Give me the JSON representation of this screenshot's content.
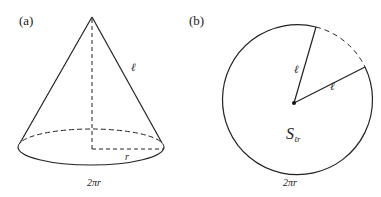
{
  "panel_a": {
    "label": "(a)",
    "slant_label": "ℓ",
    "radius_label": "r",
    "circumference_label": "2πr"
  },
  "panel_b": {
    "label": "(b)",
    "radius_label_1": "ℓ",
    "radius_label_2": "ℓ",
    "area_label_main": "S",
    "area_label_sub": "ℓr",
    "circumference_label": "2πr"
  },
  "colors": {
    "stroke": "#222222",
    "background": "#ffffff"
  }
}
